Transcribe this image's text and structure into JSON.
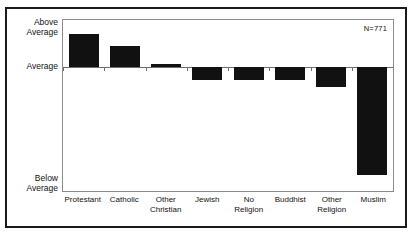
{
  "figure": {
    "n_annotation": "N=771"
  },
  "chart_data": {
    "type": "bar",
    "title": "",
    "xlabel": "",
    "ylabel": "",
    "categories": [
      "Protestant",
      "Catholic",
      "Other Christian",
      "Jewish",
      "No Religion",
      "Buddhist",
      "Other Religion",
      "Muslim"
    ],
    "category_labels": [
      "Protestant",
      "Catholic",
      "Other\nChristian",
      "Jewish",
      "No Religion",
      "Buddhist",
      "Other\nReligion",
      "Muslim"
    ],
    "values": [
      1.04,
      0.66,
      0.09,
      -0.41,
      -0.41,
      -0.41,
      -0.63,
      -3.4
    ],
    "ylim": [
      -3.96,
      1.48
    ],
    "ytick_labels": [
      "Above\nAverage",
      "Average",
      "Below\nAverage"
    ],
    "ytick_values": [
      1.48,
      0,
      -3.96
    ],
    "grid": false,
    "legend": null,
    "annotations": [
      "N=771"
    ],
    "bar_color": "#111111",
    "axis_color": "#6e6e6e",
    "border_color": "#1a1a1a"
  }
}
